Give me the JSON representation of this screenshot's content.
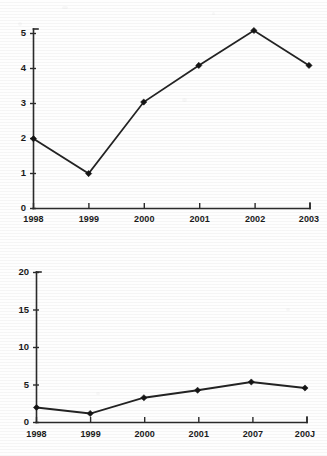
{
  "chart_data": [
    {
      "id": "top",
      "type": "line",
      "title": "",
      "xlabel": "",
      "ylabel": "",
      "categories": [
        "1998",
        "1999",
        "2000",
        "2001",
        "2002",
        "2003"
      ],
      "values": [
        2.0,
        1.0,
        3.05,
        4.1,
        5.1,
        4.1
      ],
      "yticks": [
        "0",
        "1",
        "2",
        "3",
        "4",
        "5"
      ],
      "ytick_values": [
        0,
        1,
        2,
        3,
        4,
        5
      ],
      "ylim": [
        0,
        5.35
      ],
      "grid": false,
      "legend": "none",
      "marker": "diamond",
      "line_color": "#232323",
      "marker_color": "#151515",
      "axis_color": "#2b2b2b"
    },
    {
      "id": "bottom",
      "type": "line",
      "title": "",
      "xlabel": "",
      "ylabel": "",
      "categories": [
        "1998",
        "1999",
        "2000",
        "2001",
        "2007",
        "200J"
      ],
      "values": [
        2.0,
        1.2,
        3.3,
        4.3,
        5.4,
        4.6
      ],
      "yticks": [
        "0",
        "5",
        "10",
        "15",
        "20"
      ],
      "ytick_values": [
        0,
        5,
        10,
        15,
        20
      ],
      "ylim": [
        0,
        20
      ],
      "grid": false,
      "legend": "none",
      "marker": "diamond",
      "line_color": "#232323",
      "marker_color": "#151515",
      "axis_color": "#2b2b2b"
    }
  ]
}
